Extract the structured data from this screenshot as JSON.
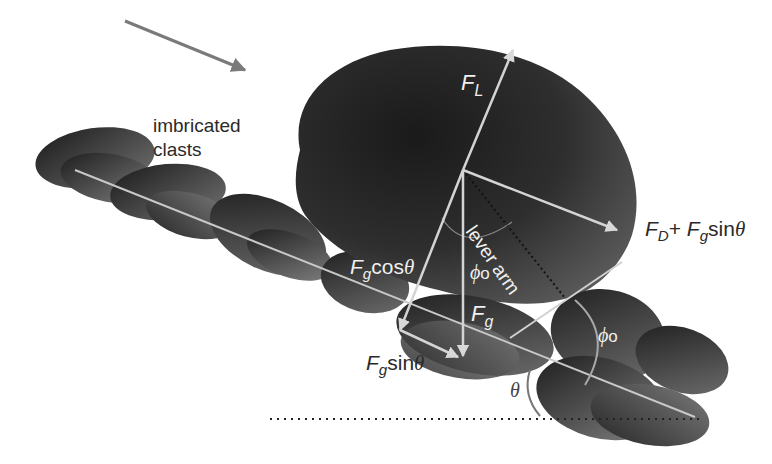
{
  "labels": {
    "clasts_line1": "imbricated",
    "clasts_line2": "clasts",
    "lift": {
      "main": "F",
      "sub": "L"
    },
    "drag": {
      "f1": "F",
      "s1": "D",
      "plus": "+ ",
      "f2": "F",
      "s2": "g",
      "fn": "sin",
      "theta": "θ"
    },
    "gcos": {
      "f": "F",
      "s": "g",
      "fn": "cos",
      "theta": "θ"
    },
    "gsin": {
      "f": "F",
      "s": "g",
      "fn": "sin",
      "theta": "θ"
    },
    "grav": {
      "f": "F",
      "s": "g"
    },
    "phi_top": {
      "phi": "ϕ",
      "sub": "o"
    },
    "phi_right": {
      "phi": "ϕ",
      "sub": "o"
    },
    "theta": "θ",
    "lever_arm": "lever arm"
  },
  "colors": {
    "flow_arrow": "#7a7a7a",
    "vector": "#d4d4d4",
    "clast_dark": "#1e1e1e",
    "clast_light": "#6e6e6e",
    "background": "#ffffff"
  }
}
